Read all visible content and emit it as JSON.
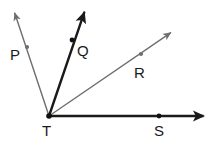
{
  "figure": {
    "type": "geometry-angle-diagram",
    "width": 221,
    "height": 144,
    "background_color": "#ffffff"
  },
  "colors": {
    "dark_stroke": "#1a1a1a",
    "light_stroke": "#6f6f6f",
    "label_color": "#1a1a1a",
    "point_dark": "#111111",
    "point_light": "#6f6f6f"
  },
  "vertex": {
    "label": "T",
    "x": 49,
    "y": 116,
    "dot_radius": 2.6,
    "label_x": 42,
    "label_y": 123
  },
  "rays": [
    {
      "id": "ray-tp",
      "label": "P",
      "from_label": "T",
      "color": "#6f6f6f",
      "stroke_width": 1.4,
      "start_x": 49,
      "start_y": 116,
      "end_x": 14,
      "end_y": 11,
      "arrowhead": true,
      "point": {
        "x": 27,
        "y": 47,
        "radius": 2.1,
        "color": "#6f6f6f"
      },
      "label_x": 10,
      "label_y": 47
    },
    {
      "id": "ray-tq",
      "label": "Q",
      "from_label": "T",
      "color": "#1a1a1a",
      "stroke_width": 2.4,
      "start_x": 49,
      "start_y": 116,
      "end_x": 85,
      "end_y": 10,
      "arrowhead": true,
      "point": {
        "x": 72,
        "y": 40,
        "radius": 2.4,
        "color": "#111111"
      },
      "label_x": 77,
      "label_y": 43
    },
    {
      "id": "ray-tr",
      "label": "R",
      "from_label": "T",
      "color": "#6f6f6f",
      "stroke_width": 1.4,
      "start_x": 49,
      "start_y": 116,
      "end_x": 173,
      "end_y": 31,
      "arrowhead": true,
      "point": {
        "x": 141,
        "y": 54,
        "radius": 2.1,
        "color": "#6f6f6f"
      },
      "label_x": 134,
      "label_y": 65
    },
    {
      "id": "ray-ts",
      "label": "S",
      "from_label": "T",
      "color": "#1a1a1a",
      "stroke_width": 2.4,
      "start_x": 49,
      "start_y": 116,
      "end_x": 208,
      "end_y": 116,
      "arrowhead": true,
      "point": {
        "x": 159,
        "y": 116,
        "radius": 2.4,
        "color": "#111111"
      },
      "label_x": 154,
      "label_y": 123
    }
  ],
  "labels": {
    "p": "P",
    "q": "Q",
    "r": "R",
    "t": "T",
    "s": "S"
  }
}
